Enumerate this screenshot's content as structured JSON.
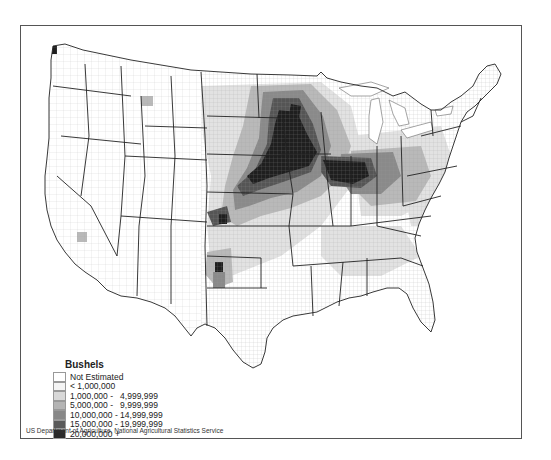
{
  "map": {
    "subject": "Corn production by county, United States",
    "legend": {
      "title": "Bushels",
      "items": [
        {
          "label": "Not Estimated",
          "color": "#ffffff"
        },
        {
          "label": "< 1,000,000",
          "color": "#f4f4f4"
        },
        {
          "label": "1,000,000 -   4,999,999",
          "color": "#d8d8d8"
        },
        {
          "label": "5,000,000 -   9,999,999",
          "color": "#b4b4b4"
        },
        {
          "label": "10,000,000 - 14,999,999",
          "color": "#888888"
        },
        {
          "label": "15,000,000 - 19,999,999",
          "color": "#5a5a5a"
        },
        {
          "label": "20,000,000 +",
          "color": "#2a2a2a"
        }
      ]
    },
    "source": "US Department of Agriculture, National Agricultural Statistics Service"
  }
}
